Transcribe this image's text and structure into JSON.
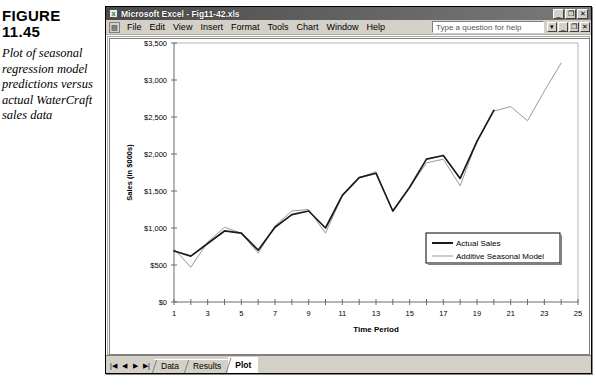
{
  "caption": {
    "figure_label": "FIGURE",
    "figure_number": "11.45",
    "description": "Plot of seasonal regression model predictions versus actual WaterCraft sales data"
  },
  "window": {
    "title": "Microsoft Excel - Fig11-42.xls",
    "app_icon": "excel-icon",
    "titlebar_buttons": [
      {
        "name": "minimize",
        "glyph": "_"
      },
      {
        "name": "restore",
        "glyph": "❐"
      },
      {
        "name": "close",
        "glyph": "✕"
      }
    ],
    "menu": {
      "doc_icon": "workbook-icon",
      "items": [
        "File",
        "Edit",
        "View",
        "Insert",
        "Format",
        "Tools",
        "Chart",
        "Window",
        "Help"
      ],
      "help_placeholder": "Type a question for help",
      "doc_buttons": [
        {
          "name": "dropdown",
          "glyph": "▾"
        },
        {
          "name": "minimize",
          "glyph": "_"
        },
        {
          "name": "restore",
          "glyph": "❐"
        },
        {
          "name": "close",
          "glyph": "✕"
        }
      ]
    },
    "tabbar": {
      "nav_buttons": [
        "|◀",
        "◀",
        "▶",
        "▶|"
      ],
      "sheets": [
        "Data",
        "Results",
        "Plot"
      ],
      "active_sheet": "Plot"
    }
  },
  "chart_data": {
    "type": "line",
    "title": "",
    "xlabel": "Time Period",
    "ylabel": "Sales (in $000s)",
    "xlim": [
      1,
      25
    ],
    "ylim": [
      0,
      3500
    ],
    "ytick_step": 500,
    "ytick_labels": [
      "$0",
      "$500",
      "$1,000",
      "$1,500",
      "$2,000",
      "$2,500",
      "$3,000",
      "$3,500"
    ],
    "ytick_values": [
      0,
      500,
      1000,
      1500,
      2000,
      2500,
      3000,
      3500
    ],
    "xtick_values": [
      1,
      2,
      3,
      4,
      5,
      6,
      7,
      8,
      9,
      10,
      11,
      12,
      13,
      14,
      15,
      16,
      17,
      18,
      19,
      20,
      21,
      22,
      23,
      24,
      25
    ],
    "xtick_labels": [
      "1",
      "",
      "3",
      "",
      "5",
      "",
      "7",
      "",
      "9",
      "",
      "11",
      "",
      "13",
      "",
      "15",
      "",
      "17",
      "",
      "19",
      "",
      "21",
      "",
      "23",
      "",
      "25"
    ],
    "grid": false,
    "legend_position": "inside-lower-right",
    "colors": {
      "actual": "#1a1a1a",
      "model": "#9a9a9a",
      "frame": "#808080"
    },
    "series": [
      {
        "name": "Actual Sales",
        "color": "#1a1a1a",
        "x": [
          1,
          2,
          3,
          4,
          5,
          6,
          7,
          8,
          9,
          10,
          11,
          12,
          13,
          14,
          15,
          16,
          17,
          18,
          19,
          20
        ],
        "values": [
          690,
          620,
          790,
          960,
          930,
          700,
          1010,
          1180,
          1230,
          1000,
          1440,
          1680,
          1740,
          1230,
          1550,
          1930,
          1980,
          1670,
          2170,
          2590
        ]
      },
      {
        "name": "Additive Seasonal Model",
        "color": "#9a9a9a",
        "x": [
          1,
          2,
          3,
          4,
          5,
          6,
          7,
          8,
          9,
          10,
          11,
          12,
          13,
          14,
          15,
          16,
          17,
          18,
          19,
          20,
          21,
          22,
          23,
          24
        ],
        "values": [
          720,
          470,
          810,
          1010,
          930,
          660,
          1030,
          1230,
          1250,
          930,
          1440,
          1680,
          1760,
          1220,
          1550,
          1880,
          1930,
          1570,
          2180,
          2580,
          2640,
          2450,
          2850,
          3230
        ]
      }
    ],
    "legend_entries": [
      {
        "label": "Actual Sales",
        "color": "#1a1a1a"
      },
      {
        "label": "Additive Seasonal Model",
        "color": "#9a9a9a"
      }
    ]
  }
}
